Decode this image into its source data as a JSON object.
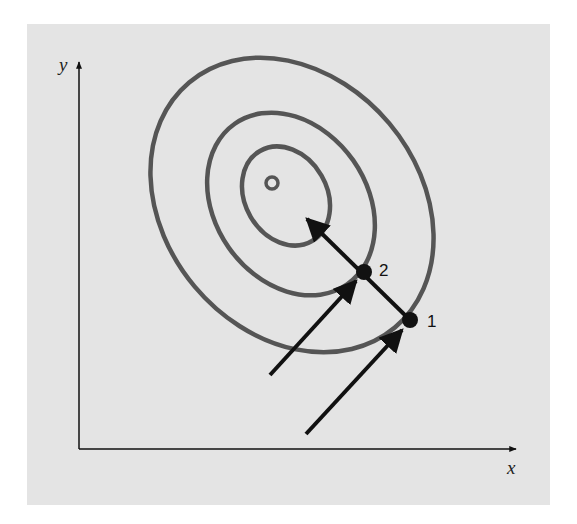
{
  "diagram": {
    "axes": {
      "x_label": "x",
      "y_label": "y"
    },
    "points": [
      {
        "label": "1",
        "x": 410,
        "y": 320
      },
      {
        "label": "2",
        "x": 364,
        "y": 272
      }
    ],
    "contours": 3,
    "optimum_marker": "small circle at center",
    "colors": {
      "background": "#e4e4e4",
      "contour": "#555555",
      "arrow": "#111111"
    }
  }
}
